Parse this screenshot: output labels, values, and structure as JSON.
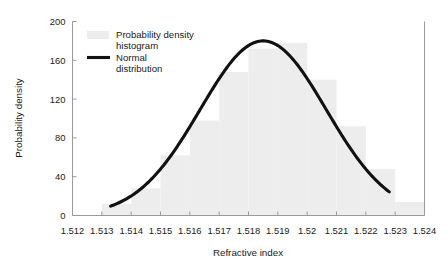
{
  "chart_data": {
    "type": "bar",
    "title": "",
    "xlabel": "Refractive index",
    "ylabel": "Probability density",
    "xlim": [
      1.512,
      1.524
    ],
    "ylim": [
      0,
      200
    ],
    "grid": false,
    "xticks": [
      1.512,
      1.513,
      1.514,
      1.515,
      1.516,
      1.517,
      1.518,
      1.519,
      1.52,
      1.521,
      1.522,
      1.523,
      1.524
    ],
    "xtick_labels": [
      "1.512",
      "1.513",
      "1.514",
      "1.515",
      "1.516",
      "1.517",
      "1.518",
      "1.519",
      "1.52",
      "1.521",
      "1.522",
      "1.523",
      "1.524"
    ],
    "yticks": [
      0,
      40,
      80,
      120,
      160,
      200
    ],
    "ytick_labels": [
      "0",
      "40",
      "80",
      "120",
      "160",
      "200"
    ],
    "legend_position": "upper-left-inside",
    "series": [
      {
        "name": "Probability density histogram",
        "type": "histogram",
        "color": "#ededed",
        "bin_width": 0.001,
        "bin_edges": [
          1.513,
          1.514,
          1.515,
          1.516,
          1.517,
          1.518,
          1.519,
          1.52,
          1.521,
          1.522,
          1.523,
          1.524
        ],
        "bin_centers": [
          1.5135,
          1.5145,
          1.5155,
          1.5165,
          1.5175,
          1.5185,
          1.5195,
          1.5205,
          1.5215,
          1.5225,
          1.5235
        ],
        "values": [
          12,
          28,
          62,
          98,
          148,
          172,
          178,
          140,
          92,
          48,
          14
        ]
      },
      {
        "name": "Normal distribution",
        "type": "line",
        "color": "#111111",
        "mean": 1.5185,
        "std": 0.00215,
        "peak_value": 180,
        "x_start": 1.5133,
        "x_end": 1.5228,
        "x": [
          1.5133,
          1.5145,
          1.5155,
          1.5165,
          1.5172,
          1.5178,
          1.5185,
          1.5192,
          1.5198,
          1.5205,
          1.5213,
          1.5221,
          1.5228
        ],
        "y": [
          5,
          18,
          45,
          92,
          130,
          162,
          180,
          172,
          148,
          108,
          62,
          30,
          14
        ]
      }
    ],
    "legend_entries": [
      {
        "label_line1": "Probability density",
        "label_line2": "histogram",
        "marker": "swatch",
        "color": "#ededed"
      },
      {
        "label_line1": "Normal",
        "label_line2": "distribution",
        "marker": "line",
        "color": "#111111"
      }
    ]
  }
}
